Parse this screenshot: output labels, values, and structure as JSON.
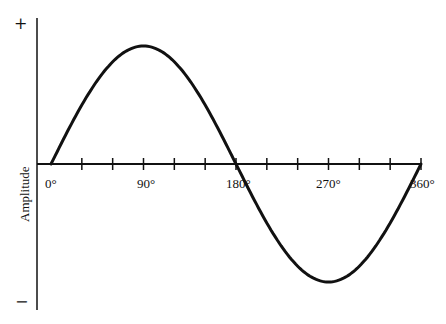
{
  "chart_data": {
    "type": "line",
    "title": "",
    "xlabel": "",
    "ylabel": "Amplitude",
    "x_tick_labels": [
      "0°",
      "90°",
      "180°",
      "270°",
      "360°"
    ],
    "x_ticks_degrees": [
      0,
      30,
      60,
      90,
      120,
      150,
      180,
      210,
      240,
      270,
      300,
      330,
      360
    ],
    "y_top_label": "+",
    "y_bottom_label": "−",
    "xlim": [
      0,
      360
    ],
    "ylim": [
      -1,
      1
    ],
    "grid": false,
    "series": [
      {
        "name": "sine wave",
        "x": [
          0,
          30,
          60,
          90,
          120,
          150,
          180,
          210,
          240,
          270,
          300,
          330,
          360
        ],
        "values": [
          0,
          0.5,
          0.866,
          1,
          0.866,
          0.5,
          0,
          -0.5,
          -0.866,
          -1,
          -0.866,
          -0.5,
          0
        ]
      }
    ]
  },
  "labels": {
    "ylabel": "Amplitude",
    "plus": "+",
    "minus": "−",
    "x0": "0°",
    "x90": "90°",
    "x180": "180°",
    "x270": "270°",
    "x360": "360°"
  }
}
